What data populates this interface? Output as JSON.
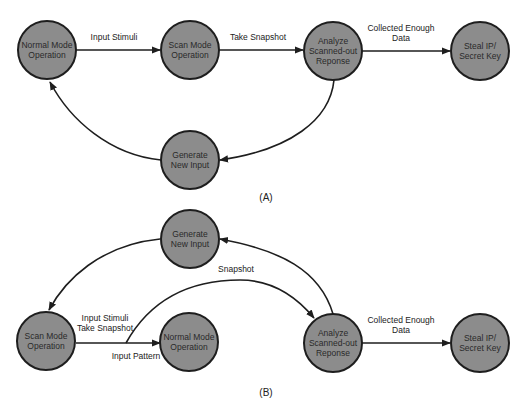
{
  "diagram": {
    "panels": [
      {
        "label": "(A)",
        "nodes": [
          {
            "id": "a_normal",
            "lines": [
              "Normal Mode",
              "Operation"
            ]
          },
          {
            "id": "a_scan",
            "lines": [
              "Scan Mode",
              "Operation"
            ]
          },
          {
            "id": "a_analyze",
            "lines": [
              "Analyze",
              "Scanned-out",
              "Reponse"
            ]
          },
          {
            "id": "a_steal",
            "lines": [
              "Steal IP/",
              "Secret Key"
            ]
          },
          {
            "id": "a_generate",
            "lines": [
              "Generate",
              "New Input"
            ]
          }
        ],
        "edges": [
          {
            "from": "a_normal",
            "to": "a_scan",
            "lines": [
              "Input Stimuli"
            ]
          },
          {
            "from": "a_scan",
            "to": "a_analyze",
            "lines": [
              "Take Snapshot"
            ]
          },
          {
            "from": "a_analyze",
            "to": "a_steal",
            "lines": [
              "Collected Enough",
              "Data"
            ]
          },
          {
            "from": "a_analyze",
            "to": "a_generate",
            "lines": []
          },
          {
            "from": "a_generate",
            "to": "a_normal",
            "lines": []
          }
        ]
      },
      {
        "label": "(B)",
        "nodes": [
          {
            "id": "b_generate",
            "lines": [
              "Generate",
              "New Input"
            ]
          },
          {
            "id": "b_scan",
            "lines": [
              "Scan Mode",
              "Operation"
            ]
          },
          {
            "id": "b_normal",
            "lines": [
              "Normal Mode",
              "Operation"
            ]
          },
          {
            "id": "b_analyze",
            "lines": [
              "Analyze",
              "Scanned-out",
              "Reponse"
            ]
          },
          {
            "id": "b_steal",
            "lines": [
              "Steal IP/",
              "Secret Key"
            ]
          }
        ],
        "edges": [
          {
            "from": "b_generate",
            "to": "b_scan",
            "lines": []
          },
          {
            "from": "b_scan",
            "to": "b_normal",
            "lines": [
              "Input Stimuli",
              "Take Snapshot"
            ],
            "below": "Input Pattern"
          },
          {
            "from": "b_scan_edge",
            "to": "b_analyze",
            "lines": [
              "Snapshot"
            ]
          },
          {
            "from": "b_analyze",
            "to": "b_generate",
            "lines": []
          },
          {
            "from": "b_analyze",
            "to": "b_steal",
            "lines": [
              "Collected Enough",
              "Data"
            ]
          }
        ]
      }
    ]
  },
  "colors": {
    "node_fill": "#8c8c8c",
    "node_stroke": "#1e1e1e",
    "edge": "#1e1e1e",
    "background": "#ffffff"
  }
}
